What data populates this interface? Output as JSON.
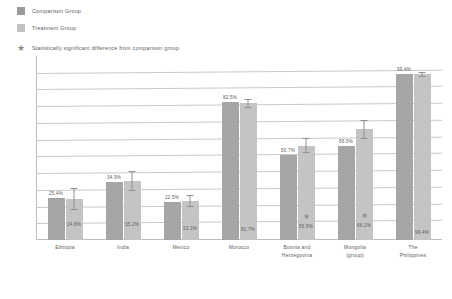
{
  "legend": {
    "items": [
      {
        "label": "Comparison Group",
        "marker": "square-swatch-dark",
        "color": "#9a9a9a"
      },
      {
        "label": "Treatment Group",
        "marker": "square-swatch-light",
        "color": "#c2c2c2"
      },
      {
        "label": "Statistically significant difference from comparison group",
        "marker": "star-icon",
        "color": "#8d8d8d"
      }
    ]
  },
  "chart_data": {
    "type": "bar",
    "title": "",
    "xlabel": "",
    "ylabel": "Business owners (%)",
    "ylim": [
      0,
      110
    ],
    "grid": true,
    "gridlines": [
      10,
      20,
      30,
      40,
      50,
      60,
      70,
      80,
      90,
      100
    ],
    "legend_position": "top-left",
    "categories": [
      "Ethiopia",
      "India",
      "Mexico",
      "Morocco",
      "Bosnia and Herzegovina",
      "Mongolia (group)",
      "The Philippines"
    ],
    "category_lines": [
      [
        "Ethiopia",
        ""
      ],
      [
        "India",
        ""
      ],
      [
        "Mexico",
        ""
      ],
      [
        "Morocco",
        ""
      ],
      [
        "Bosnia and",
        "Herzegovina"
      ],
      [
        "Mongolia",
        "(group)"
      ],
      [
        "The",
        "Philippines"
      ]
    ],
    "series": [
      {
        "name": "Comparison Group",
        "color": "#9b9b9b",
        "values": [
          25.4,
          34.9,
          22.5,
          82.5,
          50.7,
          56.5,
          99.4
        ],
        "labels": [
          "25.4%",
          "34.9%",
          "22.5%",
          "82.5%",
          "50.7%",
          "56.5%",
          "99.4%"
        ]
      },
      {
        "name": "Treatment Group",
        "color": "#c4c4c4",
        "values": [
          24.8,
          35.2,
          23.3,
          81.7,
          56.5,
          66.1,
          99.4
        ],
        "labels": [
          "24.8%",
          "35.2%",
          "23.3%",
          "81.7%",
          "56.5%",
          "66.1%",
          "99.4%"
        ],
        "error_low": [
          18.0,
          29.5,
          19.5,
          79.0,
          52.0,
          60.5,
          97.5
        ],
        "error_high": [
          31.0,
          41.0,
          27.0,
          84.5,
          61.0,
          71.5,
          100.5
        ]
      }
    ],
    "significance_markers": [
      false,
      false,
      false,
      false,
      true,
      true,
      false
    ],
    "significance_symbol": "★"
  }
}
